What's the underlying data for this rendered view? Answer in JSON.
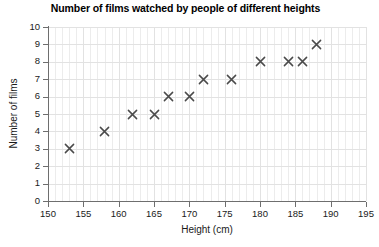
{
  "chart_data": {
    "type": "scatter",
    "title": "Number of films watched by people of different heights",
    "xlabel": "Height (cm)",
    "ylabel": "Number of films",
    "xlim": [
      150,
      195
    ],
    "ylim": [
      0,
      10
    ],
    "x_ticks": [
      150,
      155,
      160,
      165,
      170,
      175,
      180,
      185,
      190,
      195
    ],
    "y_ticks": [
      0,
      1,
      2,
      3,
      4,
      5,
      6,
      7,
      8,
      9,
      10
    ],
    "grid": true,
    "legend": "none",
    "marker": "x",
    "marker_color": "#4a4a4a",
    "points": [
      {
        "x": 153,
        "y": 3
      },
      {
        "x": 158,
        "y": 4
      },
      {
        "x": 162,
        "y": 5
      },
      {
        "x": 165,
        "y": 5
      },
      {
        "x": 167,
        "y": 6
      },
      {
        "x": 170,
        "y": 6
      },
      {
        "x": 172,
        "y": 7
      },
      {
        "x": 176,
        "y": 7
      },
      {
        "x": 180,
        "y": 8
      },
      {
        "x": 184,
        "y": 8
      },
      {
        "x": 186,
        "y": 8
      },
      {
        "x": 188,
        "y": 9
      }
    ]
  }
}
